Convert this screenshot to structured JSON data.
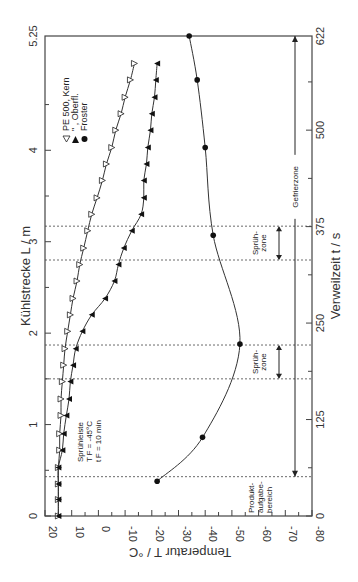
{
  "chart_data": {
    "type": "line",
    "orientation": "rotated-90",
    "title": "",
    "axes": {
      "temperature": {
        "label": "Temperatur T / °C",
        "ticks": [
          "20",
          "10",
          "0",
          "-10",
          "-20",
          "-30",
          "-40",
          "-50",
          "-60",
          "-70",
          "-80"
        ],
        "range": [
          20,
          -80
        ]
      },
      "length": {
        "label": "Kühlstrecke L / m",
        "ticks": [
          "0",
          "1",
          "2",
          "3",
          "4",
          "5.25"
        ],
        "range": [
          0,
          5.25
        ]
      },
      "time": {
        "label": "Verweilzeit t / s",
        "ticks": [
          "0",
          "125",
          "250",
          "375",
          "500",
          "622"
        ],
        "range": [
          0,
          622
        ]
      }
    },
    "legend": [
      {
        "marker": "open-triangle-down",
        "label": "PE 500, Kern"
      },
      {
        "marker": "filled-triangle-up",
        "label": "\"  , Oberfl."
      },
      {
        "marker": "filled-circle",
        "label": "Froster"
      }
    ],
    "series": [
      {
        "name": "PE 500, Kern",
        "L": [
          0,
          0.18,
          0.35,
          0.53,
          0.72,
          0.9,
          1.1,
          1.28,
          1.47,
          1.65,
          1.83,
          2.02,
          2.2,
          2.38,
          2.57,
          2.75,
          2.93,
          3.12,
          3.3,
          3.48,
          3.67,
          3.85,
          4.03,
          4.22,
          4.4,
          4.58,
          4.77,
          4.95
        ],
        "T": [
          15,
          15,
          15,
          15,
          14.5,
          14.5,
          14,
          14,
          13.5,
          13,
          12.5,
          11.5,
          10.5,
          9.5,
          8,
          7,
          5.5,
          4,
          2.5,
          0.5,
          -1.5,
          -3,
          -5,
          -6.5,
          -8.5,
          -10,
          -12,
          -13.5
        ]
      },
      {
        "name": "PE 500, Oberfl.",
        "L": [
          0,
          0.18,
          0.35,
          0.53,
          0.72,
          0.9,
          1.1,
          1.28,
          1.47,
          1.65,
          1.83,
          2.02,
          2.2,
          2.38,
          2.57,
          2.75,
          2.93,
          3.12,
          3.3,
          3.48,
          3.67,
          3.85,
          4.03,
          4.22,
          4.4,
          4.58,
          4.77,
          4.95
        ],
        "T": [
          15,
          15,
          15,
          15,
          13.5,
          13,
          12,
          11,
          10.5,
          9.5,
          8.5,
          6,
          2.5,
          -2.5,
          -6,
          -7.5,
          -9.5,
          -12.5,
          -16,
          -17,
          -17,
          -18,
          -18.5,
          -19.5,
          -20,
          -21,
          -21.5,
          -22
        ]
      },
      {
        "name": "Froster",
        "L": [
          0.38,
          0.86,
          1.88,
          3.07,
          4.03,
          4.77,
          5.25
        ],
        "T": [
          -22,
          -39,
          -53,
          -43,
          -40,
          -37,
          -34
        ]
      }
    ],
    "annotations": [
      {
        "text": "Sprühleiste",
        "sub": [
          "T_F = -45°C",
          "t_F = 10 min"
        ]
      },
      {
        "text": "Sprüh-zone",
        "L_range": [
          1.5,
          1.87
        ]
      },
      {
        "text": "Sprüh-zone",
        "L_range": [
          2.8,
          3.17
        ]
      },
      {
        "text": "Gefrierzone",
        "L_range": [
          0.43,
          5.25
        ]
      },
      {
        "text": "Produkt-aufgabe-bereich",
        "L": 0.43
      }
    ],
    "dashed_lines_L": [
      0.43,
      1.5,
      1.87,
      2.8,
      3.17
    ],
    "grid": false
  },
  "labels": {
    "temp_axis_title": "Temperatur T / °C",
    "length_axis_title": "Kühlstrecke L / m",
    "time_axis_title": "Verweilzeit t / s",
    "legend_1": "PE 500, Kern",
    "legend_2": "\"    , Oberfl.",
    "legend_3": "Froster",
    "sprueh_1": "Sprühleiste",
    "sprueh_2": "T",
    "sprueh_2b": "F",
    "sprueh_2c": " = -45°C",
    "sprueh_3": "t",
    "sprueh_3b": "F",
    "sprueh_3c": " = 10 min",
    "zone_a_1": "Sprüh-",
    "zone_a_2": "zone",
    "zone_b_1": "Sprüh-",
    "zone_b_2": "zone",
    "gefrierzone": "Gefrierzone",
    "produkt_1": "Produkt-",
    "produkt_2": "aufgabe-",
    "produkt_3": "bereich",
    "t_ticks": [
      "20",
      "10",
      "0",
      "-10",
      "-20",
      "-30",
      "-40",
      "-50",
      "-60",
      "-70",
      "-80"
    ],
    "l_ticks": [
      "0",
      "1",
      "2",
      "3",
      "4",
      "5.25"
    ],
    "time_ticks": [
      "0",
      "125",
      "250",
      "375",
      "500",
      "622"
    ]
  }
}
